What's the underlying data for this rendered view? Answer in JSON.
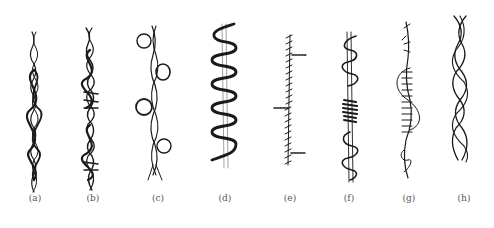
{
  "figure": {
    "panels": [
      {
        "id": "a",
        "label": "(a)",
        "x": 35
      },
      {
        "id": "b",
        "label": "(b)",
        "x": 93
      },
      {
        "id": "c",
        "label": "(c)",
        "x": 158
      },
      {
        "id": "d",
        "label": "(d)",
        "x": 225
      },
      {
        "id": "e",
        "label": "(e)",
        "x": 290
      },
      {
        "id": "f",
        "label": "(f)",
        "x": 349
      },
      {
        "id": "g",
        "label": "(g)",
        "x": 409
      },
      {
        "id": "h",
        "label": "(h)",
        "x": 464
      }
    ],
    "colors": {
      "ink": "#1a1a1a",
      "label": "#555555",
      "background": "#ffffff"
    }
  }
}
